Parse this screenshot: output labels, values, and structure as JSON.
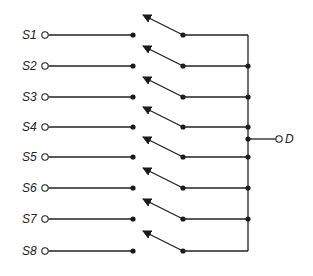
{
  "diagram": {
    "colors": {
      "ink": "#222222",
      "background": "#ffffff"
    },
    "inputs": [
      {
        "label": "S1",
        "y": 35
      },
      {
        "label": "S2",
        "y": 66
      },
      {
        "label": "S3",
        "y": 97
      },
      {
        "label": "S4",
        "y": 127
      },
      {
        "label": "S5",
        "y": 157
      },
      {
        "label": "S6",
        "y": 188
      },
      {
        "label": "S7",
        "y": 219
      },
      {
        "label": "S8",
        "y": 251
      }
    ],
    "output": {
      "label": "D",
      "y": 139
    },
    "geometry": {
      "label_x": 22,
      "terminal_x": 45,
      "contact_x": 133,
      "pivot_x": 183,
      "arrow_tip_x": 143,
      "arrow_rise": 20,
      "bus_x": 248,
      "output_terminal_x": 279,
      "output_label_x": 285
    }
  }
}
